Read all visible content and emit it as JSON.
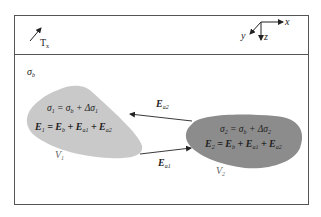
{
  "diagram": {
    "colors": {
      "frame": "#555555",
      "region1_fill": "#c9c9c9",
      "region2_fill": "#8c8c8c",
      "arrow": "#222222"
    },
    "top_strip": {
      "transmitter_label": "T",
      "transmitter_sub": "x",
      "axes": {
        "x": "x",
        "y": "y",
        "z": "z"
      }
    },
    "background": {
      "conductivity_symbol": "σ",
      "conductivity_sub": "b"
    },
    "region1": {
      "sigma": "σ",
      "sigma_sub": "1",
      "eq_sigma_rhs": "= σ",
      "eq_sigma_rhs_sub": "b",
      "eq_sigma_delta": "+ Δσ",
      "eq_sigma_delta_sub": "1",
      "field": "E",
      "field_sub": "1",
      "eq_field_1": "= E",
      "eq_field_1_sub": "b",
      "eq_field_2": "+ E",
      "eq_field_2_sub": "a1",
      "eq_field_3": "+ E",
      "eq_field_3_sub": "a2",
      "volume": "V",
      "volume_sub": "1"
    },
    "region2": {
      "sigma": "σ",
      "sigma_sub": "2",
      "eq_sigma_rhs": "= σ",
      "eq_sigma_rhs_sub": "b",
      "eq_sigma_delta": "+ Δσ",
      "eq_sigma_delta_sub": "2",
      "field": "E",
      "field_sub": "2",
      "eq_field_1": "= E",
      "eq_field_1_sub": "b",
      "eq_field_2": "+ E",
      "eq_field_2_sub": "a1",
      "eq_field_3": "+ E",
      "eq_field_3_sub": "a2",
      "volume": "V",
      "volume_sub": "2"
    },
    "arrows": {
      "ea2": {
        "symbol": "E",
        "sub": "a2"
      },
      "ea1": {
        "symbol": "E",
        "sub": "a1"
      }
    }
  }
}
